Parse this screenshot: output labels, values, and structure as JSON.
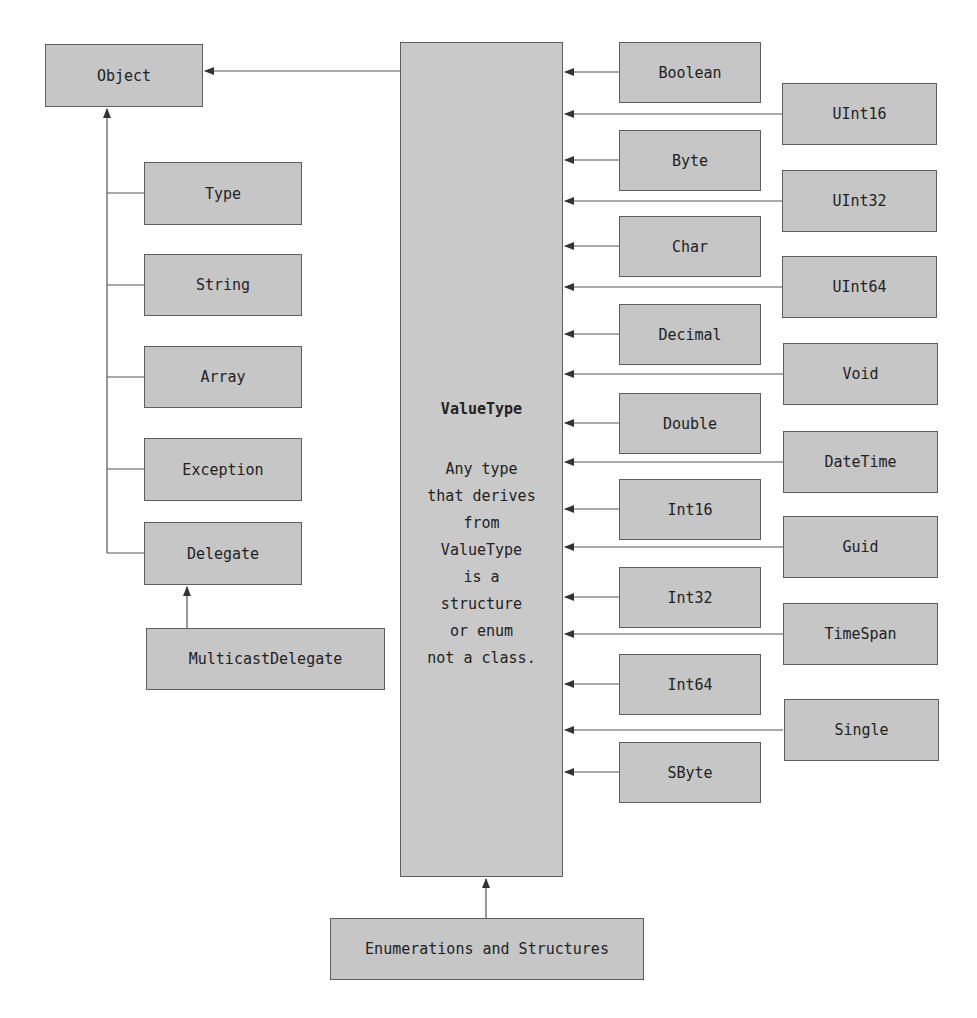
{
  "diagram": {
    "nodes": {
      "object": {
        "label": "Object",
        "x": 45,
        "y": 44,
        "w": 158,
        "h": 63
      },
      "type": {
        "label": "Type",
        "x": 144,
        "y": 162,
        "w": 158,
        "h": 63
      },
      "string": {
        "label": "String",
        "x": 144,
        "y": 254,
        "w": 158,
        "h": 62
      },
      "array": {
        "label": "Array",
        "x": 144,
        "y": 346,
        "w": 158,
        "h": 62
      },
      "exception": {
        "label": "Exception",
        "x": 144,
        "y": 438,
        "w": 158,
        "h": 63
      },
      "delegate": {
        "label": "Delegate",
        "x": 144,
        "y": 522,
        "w": 158,
        "h": 63
      },
      "multicast_delegate": {
        "label": "MulticastDelegate",
        "x": 146,
        "y": 628,
        "w": 239,
        "h": 62
      },
      "value_type": {
        "label": "ValueType",
        "description_lines": [
          "Any type",
          "that derives",
          "from",
          "ValueType",
          "is a",
          "structure",
          "or enum",
          "not a class."
        ],
        "x": 400,
        "y": 42,
        "w": 163,
        "h": 835
      },
      "enumerations_structures": {
        "label": "Enumerations and Structures",
        "x": 330,
        "y": 918,
        "w": 314,
        "h": 62
      }
    },
    "left_column": [
      {
        "label": "Boolean",
        "y": 42
      },
      {
        "label": "Byte",
        "y": 130
      },
      {
        "label": "Char",
        "y": 216
      },
      {
        "label": "Decimal",
        "y": 304
      },
      {
        "label": "Double",
        "y": 393
      },
      {
        "label": "Int16",
        "y": 479
      },
      {
        "label": "Int32",
        "y": 567
      },
      {
        "label": "Int64",
        "y": 654
      },
      {
        "label": "SByte",
        "y": 742
      }
    ],
    "right_column": [
      {
        "label": "UInt16",
        "y": 83
      },
      {
        "label": "UInt32",
        "y": 170
      },
      {
        "label": "UInt64",
        "y": 256
      },
      {
        "label": "Void",
        "y": 343
      },
      {
        "label": "DateTime",
        "y": 431
      },
      {
        "label": "Guid",
        "y": 516
      },
      {
        "label": "TimeSpan",
        "y": 603
      },
      {
        "label": "Single",
        "y": 699
      }
    ],
    "colors": {
      "box_fill": "#c6c6c6",
      "box_border": "#5e5e5e",
      "line": "#444444",
      "text": "#222222"
    }
  }
}
